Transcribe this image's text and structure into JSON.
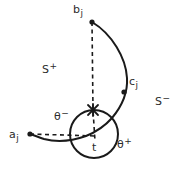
{
  "figure": {
    "title": "",
    "width": 180,
    "height": 169,
    "background": "#ffffff",
    "stroke_color": "#1a1a1a",
    "text_color": "#2b2b2b"
  },
  "labels": {
    "b_j": {
      "base": "b",
      "sub": "j",
      "sup": ""
    },
    "a_j": {
      "base": "a",
      "sub": "j",
      "sup": ""
    },
    "c_j": {
      "base": "c",
      "sub": "j",
      "sup": ""
    },
    "s_plus": {
      "base": "S",
      "sub": "",
      "sup": "+"
    },
    "s_minus": {
      "base": "S",
      "sub": "",
      "sup": "−"
    },
    "theta_minus": {
      "base": "θ",
      "sub": "",
      "sup": "−"
    },
    "theta_plus": {
      "base": "θ",
      "sub": "",
      "sup": "+"
    },
    "t": {
      "base": "t",
      "sub": "",
      "sup": ""
    }
  },
  "geometry": {
    "circle": {
      "cx": 94,
      "cy": 134,
      "r": 24
    },
    "cross_marker": {
      "x": 93,
      "y": 110,
      "size": 6
    },
    "points": [
      {
        "name": "b_j",
        "x": 92,
        "y": 22
      },
      {
        "name": "a_j",
        "x": 30,
        "y": 134
      },
      {
        "name": "c_j",
        "x": 124,
        "y": 92
      },
      {
        "name": "t",
        "x": 94,
        "y": 134
      }
    ],
    "dashed_vertical": {
      "x1": 92,
      "y1": 22,
      "x2": 95,
      "y2": 140
    },
    "dashed_horizontal": {
      "x1": 30,
      "y1": 134,
      "x2": 96,
      "y2": 136
    },
    "solid_curve": "a_j -> under circle -> through circle -> c_j -> b_j"
  }
}
